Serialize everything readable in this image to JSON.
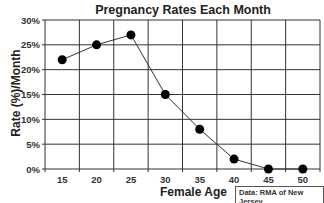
{
  "chart_data": {
    "type": "line",
    "title": "Pregnancy Rates Each Month",
    "xlabel": "Female Age",
    "ylabel": "Rate (%)/Month",
    "x": [
      15,
      20,
      25,
      30,
      35,
      40,
      45,
      50
    ],
    "series": [
      {
        "name": "Pregnancy rate",
        "values": [
          22,
          25,
          27,
          15,
          8,
          2,
          0,
          0
        ]
      }
    ],
    "y_ticks": [
      "0%",
      "5%",
      "10%",
      "15%",
      "20%",
      "25%",
      "30%"
    ],
    "x_ticks": [
      "15",
      "20",
      "25",
      "30",
      "35",
      "40",
      "45",
      "50"
    ],
    "ylim": [
      0,
      30
    ],
    "grid": true,
    "legend": "none",
    "annotation": "Data: RMA of New Jersey"
  },
  "colors": {
    "line": "#333333",
    "marker": "#000000",
    "grid": "#333333"
  }
}
